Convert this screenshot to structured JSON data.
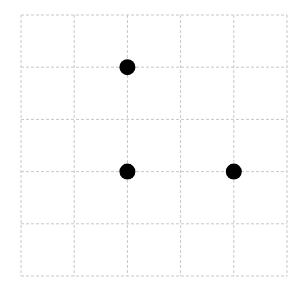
{
  "grid": {
    "rows": 5,
    "cols": 5,
    "left": 21,
    "top": 15,
    "cell_w": 53.2,
    "cell_h": 52.2,
    "line_color": "#c8c8c8",
    "dash": "3,2"
  },
  "points": [
    {
      "col": 2,
      "row": 1,
      "color": "#000000"
    },
    {
      "col": 2,
      "row": 3,
      "color": "#000000"
    },
    {
      "col": 4,
      "row": 3,
      "color": "#000000"
    }
  ],
  "point_radius": 8
}
